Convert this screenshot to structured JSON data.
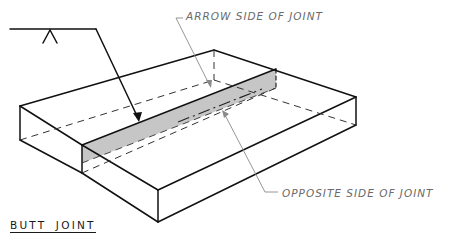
{
  "figure": {
    "title": "BUTT JOINT",
    "labels": {
      "arrow_side": "ARROW SIDE OF JOINT",
      "opposite_side": "OPPOSITE SIDE OF JOINT"
    },
    "symbol": {
      "type": "welding-reference-line",
      "mark": "arrow-side symbol (inverted V)"
    },
    "colors": {
      "line": "#111111",
      "leader": "#8a8a8a",
      "joint_face": "#c8c8c8",
      "label_text": "#6a6a6a"
    }
  }
}
